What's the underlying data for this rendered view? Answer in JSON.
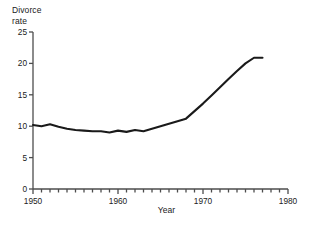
{
  "chart_data": {
    "type": "line",
    "title": "",
    "ylabel": "Divorce\nrate",
    "xlabel": "Year",
    "xlim": [
      1950,
      1980
    ],
    "ylim": [
      0,
      25
    ],
    "xticks": [
      1950,
      1960,
      1970,
      1980
    ],
    "xtick_labels": [
      "1950",
      "1960",
      "1970",
      "1980"
    ],
    "yticks": [
      0,
      5,
      10,
      15,
      20,
      25
    ],
    "ytick_labels": [
      "0",
      "5",
      "10",
      "15",
      "20",
      "25"
    ],
    "minor_xtick_interval": 1,
    "grid": false,
    "legend": false,
    "line_color": "#1a1a1a",
    "axis_color": "#4d4d4d",
    "x": [
      1950,
      1951,
      1952,
      1953,
      1954,
      1955,
      1956,
      1957,
      1958,
      1959,
      1960,
      1961,
      1962,
      1963,
      1964,
      1965,
      1966,
      1967,
      1968,
      1969,
      1970,
      1971,
      1972,
      1973,
      1974,
      1975,
      1976,
      1977
    ],
    "values": [
      10.2,
      10.0,
      10.3,
      9.9,
      9.6,
      9.4,
      9.3,
      9.2,
      9.2,
      9.0,
      9.3,
      9.1,
      9.4,
      9.2,
      9.6,
      10.0,
      10.4,
      10.8,
      11.2,
      12.4,
      13.6,
      14.9,
      16.2,
      17.5,
      18.8,
      20.0,
      20.9,
      20.9
    ]
  }
}
